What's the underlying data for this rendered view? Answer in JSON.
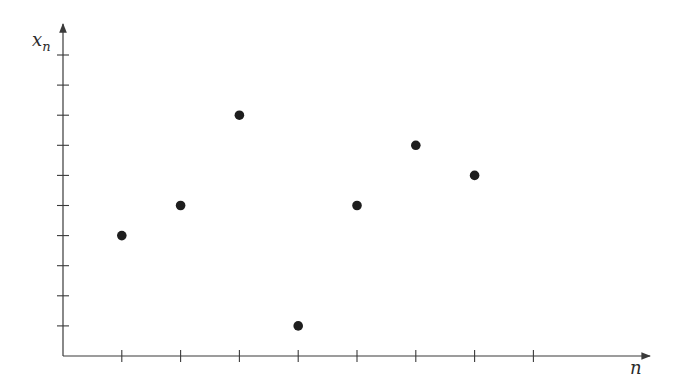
{
  "chart_data": {
    "type": "scatter",
    "title": "",
    "xlabel": "n",
    "ylabel": "x_n",
    "ylabel_main": "x",
    "ylabel_sub": "n",
    "x": [
      1,
      2,
      3,
      4,
      5,
      6,
      7
    ],
    "values": [
      4,
      5,
      8,
      1,
      5,
      7,
      6
    ],
    "series": [
      {
        "name": "x_n",
        "x": [
          1,
          2,
          3,
          4,
          5,
          6,
          7
        ],
        "values": [
          4,
          5,
          8,
          1,
          5,
          7,
          6
        ]
      }
    ],
    "xlim": [
      0,
      10
    ],
    "ylim": [
      0,
      11
    ],
    "x_ticks": [
      1,
      2,
      3,
      4,
      5,
      6,
      7,
      8
    ],
    "y_ticks": [
      1,
      2,
      3,
      4,
      5,
      6,
      7,
      8,
      9,
      10
    ],
    "tick_labels_shown": false,
    "grid": false,
    "legend": null
  },
  "style": {
    "axis_color": "#3a3a3a",
    "point_color": "#1e1e1e",
    "background": "#ffffff"
  }
}
